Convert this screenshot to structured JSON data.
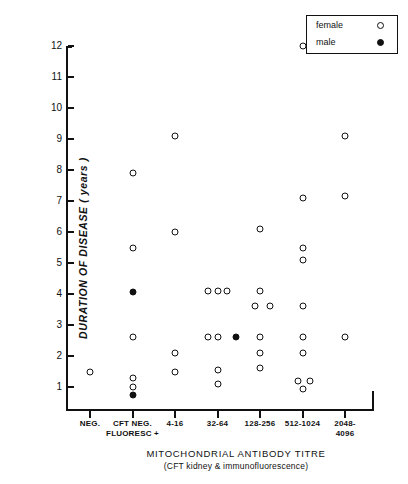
{
  "chart_data": {
    "type": "scatter",
    "title": "",
    "xlabel": "MITOCHONDRIAL  ANTIBODY  TITRE",
    "xlabel_sub": "(CFT kidney & immunofluorescence)",
    "ylabel": "DURATION  OF  DISEASE  ( years )",
    "ylim": [
      0,
      12.6
    ],
    "yticks": [
      1,
      2,
      3,
      4,
      5,
      6,
      7,
      8,
      9,
      10,
      11,
      12
    ],
    "grid": false,
    "categories": [
      "NEG.",
      "CFT NEG.\nFLUORESC +",
      "4-16",
      "32-64",
      "128-256",
      "512-1024",
      "2048-\n4096"
    ],
    "legend": {
      "position": "top-right",
      "entries": [
        {
          "name": "female",
          "marker": "open-circle"
        },
        {
          "name": "male",
          "marker": "filled-circle"
        }
      ]
    },
    "series": [
      {
        "name": "female",
        "marker": "open-circle",
        "points": [
          {
            "category": 0,
            "offset": 0.0,
            "y": 1.5
          },
          {
            "category": 1,
            "offset": 0.0,
            "y": 7.9
          },
          {
            "category": 1,
            "offset": 0.0,
            "y": 5.5
          },
          {
            "category": 1,
            "offset": 0.0,
            "y": 2.6
          },
          {
            "category": 1,
            "offset": 0.0,
            "y": 1.3
          },
          {
            "category": 1,
            "offset": 0.0,
            "y": 1.0
          },
          {
            "category": 2,
            "offset": 0.0,
            "y": 9.1
          },
          {
            "category": 2,
            "offset": 0.0,
            "y": 6.0
          },
          {
            "category": 2,
            "offset": 0.0,
            "y": 2.1
          },
          {
            "category": 2,
            "offset": 0.0,
            "y": 1.5
          },
          {
            "category": 3,
            "offset": -0.22,
            "y": 4.1
          },
          {
            "category": 3,
            "offset": 0.0,
            "y": 4.1
          },
          {
            "category": 3,
            "offset": 0.22,
            "y": 4.1
          },
          {
            "category": 3,
            "offset": -0.22,
            "y": 2.6
          },
          {
            "category": 3,
            "offset": 0.0,
            "y": 2.6
          },
          {
            "category": 3,
            "offset": 0.0,
            "y": 1.55
          },
          {
            "category": 3,
            "offset": 0.0,
            "y": 1.1
          },
          {
            "category": 4,
            "offset": 0.0,
            "y": 6.1
          },
          {
            "category": 4,
            "offset": 0.0,
            "y": 4.1
          },
          {
            "category": 4,
            "offset": -0.12,
            "y": 3.6
          },
          {
            "category": 4,
            "offset": 0.24,
            "y": 3.6
          },
          {
            "category": 4,
            "offset": 0.0,
            "y": 2.6
          },
          {
            "category": 4,
            "offset": 0.0,
            "y": 2.1
          },
          {
            "category": 4,
            "offset": 0.0,
            "y": 1.6
          },
          {
            "category": 5,
            "offset": 0.0,
            "y": 12.0
          },
          {
            "category": 5,
            "offset": 0.0,
            "y": 7.1
          },
          {
            "category": 5,
            "offset": 0.0,
            "y": 5.5
          },
          {
            "category": 5,
            "offset": 0.0,
            "y": 5.1
          },
          {
            "category": 5,
            "offset": 0.0,
            "y": 3.6
          },
          {
            "category": 5,
            "offset": 0.0,
            "y": 2.6
          },
          {
            "category": 5,
            "offset": 0.0,
            "y": 2.1
          },
          {
            "category": 5,
            "offset": -0.1,
            "y": 1.2
          },
          {
            "category": 5,
            "offset": 0.17,
            "y": 1.2
          },
          {
            "category": 5,
            "offset": 0.0,
            "y": 0.95
          },
          {
            "category": 6,
            "offset": 0.0,
            "y": 9.1
          },
          {
            "category": 6,
            "offset": 0.0,
            "y": 7.15
          },
          {
            "category": 6,
            "offset": 0.0,
            "y": 2.6
          }
        ]
      },
      {
        "name": "male",
        "marker": "filled-circle",
        "points": [
          {
            "category": 1,
            "offset": 0.0,
            "y": 4.05
          },
          {
            "category": 1,
            "offset": 0.0,
            "y": 0.75
          },
          {
            "category": 3,
            "offset": 0.44,
            "y": 2.6
          }
        ]
      }
    ]
  },
  "legend": {
    "female_label": "female",
    "male_label": "male"
  },
  "axes": {
    "y_title": "DURATION  OF  DISEASE  ( years )",
    "x_title": "MITOCHONDRIAL  ANTIBODY  TITRE",
    "x_subtitle": "(CFT kidney & immunofluorescence)"
  },
  "colors": {
    "ink": "#111111",
    "background": "#ffffff"
  }
}
